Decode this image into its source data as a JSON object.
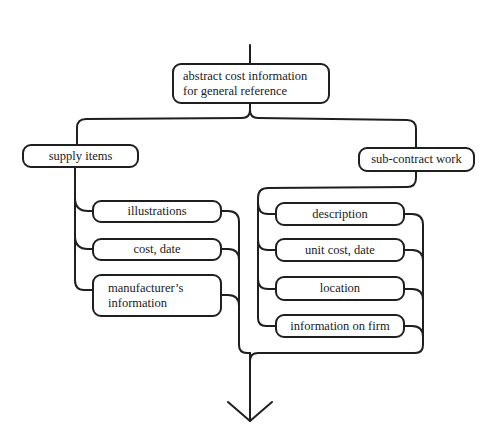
{
  "diagram": {
    "root": {
      "label_line1": "abstract cost information",
      "label_line2": "for general reference"
    },
    "branches": [
      {
        "label": "supply items",
        "children": [
          {
            "label": "illustrations"
          },
          {
            "label": "cost, date"
          },
          {
            "label_line1": "manufacturer’s",
            "label_line2": "information"
          }
        ]
      },
      {
        "label": "sub-contract work",
        "children": [
          {
            "label": "description"
          },
          {
            "label": "unit cost, date"
          },
          {
            "label": "location"
          },
          {
            "label": "information on firm"
          }
        ]
      }
    ],
    "output_arrow": "down-arrow",
    "line_color": "#1f1f1f"
  }
}
